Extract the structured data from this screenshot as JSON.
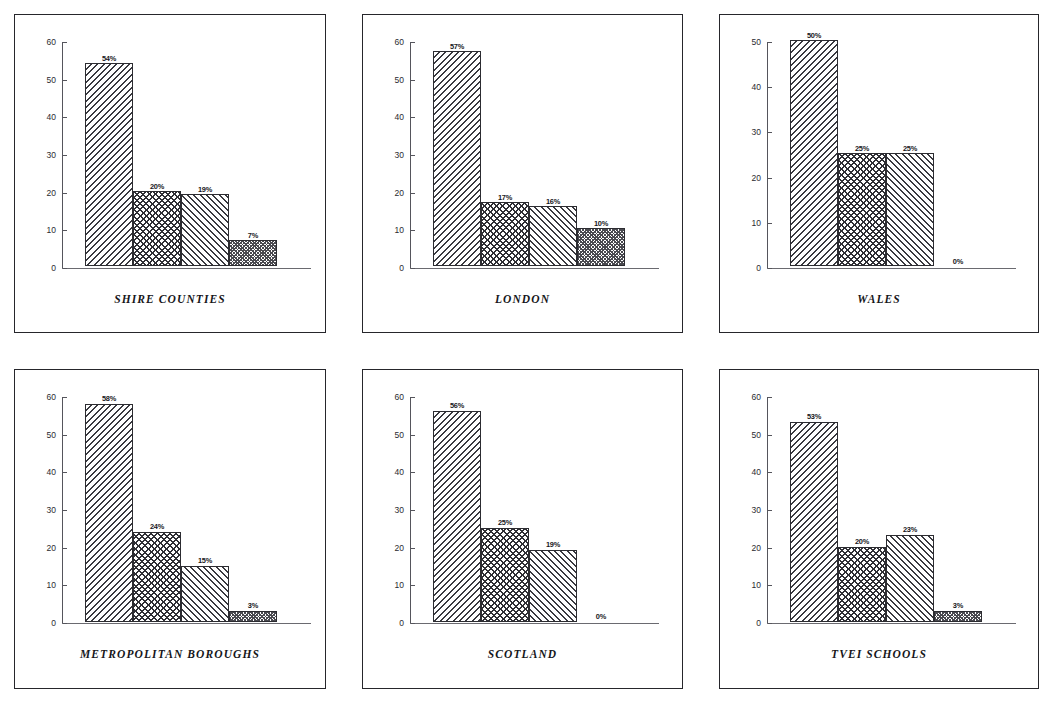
{
  "figure": {
    "layout": "2 rows x 3 columns of framed bar-chart panels",
    "panel_count": 6
  },
  "chart_data": [
    {
      "type": "bar",
      "title": "SHIRE COUNTIES",
      "categories": [
        "1",
        "2",
        "3",
        "4"
      ],
      "values": [
        54,
        20,
        19,
        7
      ],
      "data_labels": [
        "54%",
        "20%",
        "19%",
        "7%"
      ],
      "ytick_labels": [
        "0",
        "10",
        "20",
        "30",
        "40",
        "50",
        "60"
      ],
      "yticks": [
        0,
        10,
        20,
        30,
        40,
        50,
        60
      ],
      "ylim": [
        0,
        60
      ],
      "xlabel": "",
      "ylabel": "",
      "grid": false,
      "legend": "none",
      "patterns": [
        "hatch-a",
        "hatch-b",
        "hatch-c",
        "hatch-d"
      ]
    },
    {
      "type": "bar",
      "title": "LONDON",
      "categories": [
        "1",
        "2",
        "3",
        "4"
      ],
      "values": [
        57,
        17,
        16,
        10
      ],
      "data_labels": [
        "57%",
        "17%",
        "16%",
        "10%"
      ],
      "ytick_labels": [
        "0",
        "10",
        "20",
        "30",
        "40",
        "50",
        "60"
      ],
      "yticks": [
        0,
        10,
        20,
        30,
        40,
        50,
        60
      ],
      "ylim": [
        0,
        60
      ],
      "xlabel": "",
      "ylabel": "",
      "grid": false,
      "legend": "none",
      "patterns": [
        "hatch-a",
        "hatch-b",
        "hatch-c",
        "hatch-d"
      ]
    },
    {
      "type": "bar",
      "title": "WALES",
      "categories": [
        "1",
        "2",
        "3",
        "4"
      ],
      "values": [
        50,
        25,
        25,
        0
      ],
      "data_labels": [
        "50%",
        "25%",
        "25%",
        "0%"
      ],
      "ytick_labels": [
        "0",
        "10",
        "20",
        "30",
        "40",
        "50"
      ],
      "yticks": [
        0,
        10,
        20,
        30,
        40,
        50
      ],
      "ylim": [
        0,
        50
      ],
      "xlabel": "",
      "ylabel": "",
      "grid": false,
      "legend": "none",
      "patterns": [
        "hatch-a",
        "hatch-b",
        "hatch-c",
        "hatch-d"
      ]
    },
    {
      "type": "bar",
      "title": "METROPOLITAN BOROUGHS",
      "categories": [
        "1",
        "2",
        "3",
        "4"
      ],
      "values": [
        58,
        24,
        15,
        3
      ],
      "data_labels": [
        "58%",
        "24%",
        "15%",
        "3%"
      ],
      "ytick_labels": [
        "0",
        "10",
        "20",
        "30",
        "40",
        "50",
        "60"
      ],
      "yticks": [
        0,
        10,
        20,
        30,
        40,
        50,
        60
      ],
      "ylim": [
        0,
        60
      ],
      "xlabel": "",
      "ylabel": "",
      "grid": false,
      "legend": "none",
      "patterns": [
        "hatch-a",
        "hatch-b",
        "hatch-c",
        "hatch-d"
      ]
    },
    {
      "type": "bar",
      "title": "SCOTLAND",
      "categories": [
        "1",
        "2",
        "3",
        "4"
      ],
      "values": [
        56,
        25,
        19,
        0
      ],
      "data_labels": [
        "56%",
        "25%",
        "19%",
        "0%"
      ],
      "ytick_labels": [
        "0",
        "10",
        "20",
        "30",
        "40",
        "50",
        "60"
      ],
      "yticks": [
        0,
        10,
        20,
        30,
        40,
        50,
        60
      ],
      "ylim": [
        0,
        60
      ],
      "xlabel": "",
      "ylabel": "",
      "grid": false,
      "legend": "none",
      "patterns": [
        "hatch-a",
        "hatch-b",
        "hatch-c",
        "hatch-d"
      ]
    },
    {
      "type": "bar",
      "title": "TVEI SCHOOLS",
      "categories": [
        "1",
        "2",
        "3",
        "4"
      ],
      "values": [
        53,
        20,
        23,
        3
      ],
      "data_labels": [
        "53%",
        "20%",
        "23%",
        "3%"
      ],
      "ytick_labels": [
        "0",
        "10",
        "20",
        "30",
        "40",
        "50",
        "60"
      ],
      "yticks": [
        0,
        10,
        20,
        30,
        40,
        50,
        60
      ],
      "ylim": [
        0,
        60
      ],
      "xlabel": "",
      "ylabel": "",
      "grid": false,
      "legend": "none",
      "patterns": [
        "hatch-a",
        "hatch-b",
        "hatch-c",
        "hatch-d"
      ]
    }
  ]
}
